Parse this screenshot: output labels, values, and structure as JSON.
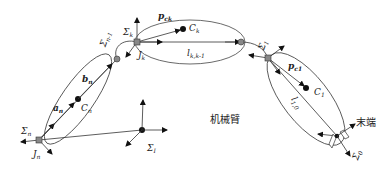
{
  "diagram": {
    "type": "robot-arm-kinematic-chain",
    "labels": {
      "sigma_n": "Σn",
      "J_n": "Jn",
      "a_n": "an",
      "b_n": "bn",
      "C_n": "Cn",
      "sigma_n_minus_1": "Σn-1",
      "sigma_k": "Σk",
      "J_k": "Jk",
      "p_ck": "pck",
      "C_k": "Ck",
      "l_kk_minus_1": "lk,k-1",
      "sigma_1": "Σ1",
      "p_c1": "pc1",
      "C_1": "C1",
      "l_10": "l1,0",
      "sigma_I": "ΣI",
      "sigma_0": "Σ0",
      "arm_label": "机械臂",
      "end_effector_label": "末端"
    },
    "colors": {
      "stroke": "#333333",
      "joint_fill": "#888888",
      "background": "#ffffff"
    }
  }
}
